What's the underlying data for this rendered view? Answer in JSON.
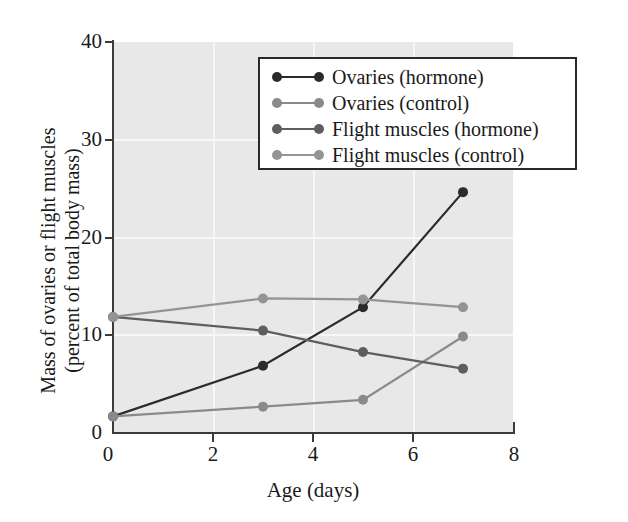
{
  "chart_data": {
    "type": "line",
    "title": "",
    "xlabel": "Age (days)",
    "ylabel": "Mass of ovaries or flight muscles (percent of total body mass)",
    "ylabel_line1": "Mass of ovaries or flight muscles",
    "ylabel_line2": "(percent of total body mass)",
    "xlim": [
      0,
      8
    ],
    "ylim": [
      0,
      40
    ],
    "xticks": [
      0,
      2,
      4,
      6,
      8
    ],
    "xticklabels": [
      "0",
      "2",
      "4",
      "6",
      "8"
    ],
    "yticks": [
      0,
      10,
      20,
      30,
      40
    ],
    "yticklabels": [
      "0",
      "10",
      "20",
      "30",
      "40"
    ],
    "grid": true,
    "legend_position": "upper center",
    "x": [
      0,
      3,
      5,
      7
    ],
    "series": [
      {
        "name": "Ovaries (hormone)",
        "color": "#2b2b2b",
        "values": [
          1.6,
          6.8,
          12.8,
          24.6
        ]
      },
      {
        "name": "Ovaries (control)",
        "color": "#8a8a8a",
        "values": [
          1.6,
          2.6,
          3.3,
          9.8
        ]
      },
      {
        "name": "Flight muscles (hormone)",
        "color": "#5e5e5e",
        "values": [
          11.8,
          10.4,
          8.2,
          6.5
        ]
      },
      {
        "name": "Flight muscles (control)",
        "color": "#949494",
        "values": [
          11.8,
          13.7,
          13.6,
          12.8
        ]
      }
    ]
  },
  "legend": {
    "items": [
      {
        "label": "Ovaries (hormone)",
        "color": "#2b2b2b"
      },
      {
        "label": "Ovaries (control)",
        "color": "#8a8a8a"
      },
      {
        "label": "Flight muscles (hormone)",
        "color": "#5e5e5e"
      },
      {
        "label": "Flight muscles (control)",
        "color": "#949494"
      }
    ]
  },
  "colors": {
    "plot_background": "#e8e8e8",
    "gridline": "#f7f7f7",
    "axis": "#3b3b3b",
    "text": "#1a1a1a",
    "page_background": "#ffffff"
  }
}
